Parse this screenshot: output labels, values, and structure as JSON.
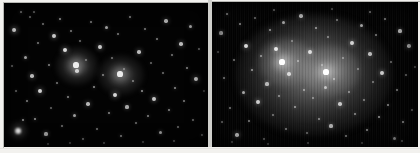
{
  "figure": {
    "background_color": "#f2f1ee",
    "width": 420,
    "height": 153,
    "divider_color": "#cfcfcb"
  },
  "panels": [
    {
      "id": "panel-left",
      "label": "Left panel",
      "description": "Raw star field with two faint compact cluster cores",
      "background_color": "#030303",
      "star_color": "#ffffff",
      "width": 204,
      "height": 144,
      "cores": [
        {
          "name": "core-a",
          "x": 72,
          "y": 62,
          "brightness": 0.46
        },
        {
          "name": "core-b",
          "x": 116,
          "y": 71,
          "brightness": 0.44
        }
      ],
      "stars": [
        [
          10,
          27,
          2.2,
          0.95
        ],
        [
          14,
          128,
          3.4,
          1.0
        ],
        [
          17,
          9,
          1.3,
          0.55
        ],
        [
          21,
          54,
          1.5,
          0.62
        ],
        [
          23,
          98,
          1.2,
          0.5
        ],
        [
          26,
          14,
          1.0,
          0.42
        ],
        [
          28,
          73,
          1.8,
          0.72
        ],
        [
          31,
          116,
          1.4,
          0.58
        ],
        [
          34,
          40,
          1.2,
          0.48
        ],
        [
          36,
          88,
          2.0,
          0.82
        ],
        [
          39,
          21,
          1.1,
          0.45
        ],
        [
          42,
          131,
          1.6,
          0.66
        ],
        [
          45,
          62,
          1.3,
          0.52
        ],
        [
          47,
          105,
          1.0,
          0.4
        ],
        [
          50,
          33,
          1.9,
          0.78
        ],
        [
          53,
          80,
          1.2,
          0.47
        ],
        [
          56,
          16,
          1.4,
          0.58
        ],
        [
          58,
          123,
          1.1,
          0.44
        ],
        [
          61,
          47,
          2.1,
          0.86
        ],
        [
          64,
          94,
          1.3,
          0.53
        ],
        [
          67,
          28,
          1.2,
          0.49
        ],
        [
          70,
          112,
          1.5,
          0.61
        ],
        [
          73,
          68,
          1.8,
          0.74
        ],
        [
          76,
          38,
          1.1,
          0.43
        ],
        [
          79,
          136,
          1.3,
          0.52
        ],
        [
          82,
          57,
          1.0,
          0.41
        ],
        [
          84,
          101,
          1.7,
          0.7
        ],
        [
          87,
          19,
          1.2,
          0.48
        ],
        [
          90,
          84,
          1.4,
          0.57
        ],
        [
          93,
          126,
          1.1,
          0.45
        ],
        [
          96,
          44,
          1.9,
          0.79
        ],
        [
          99,
          72,
          1.2,
          0.5
        ],
        [
          102,
          24,
          1.5,
          0.61
        ],
        [
          105,
          110,
          1.3,
          0.53
        ],
        [
          108,
          55,
          1.1,
          0.44
        ],
        [
          111,
          92,
          2.0,
          0.83
        ],
        [
          114,
          31,
          1.2,
          0.49
        ],
        [
          117,
          133,
          1.4,
          0.56
        ],
        [
          120,
          66,
          1.0,
          0.4
        ],
        [
          123,
          104,
          1.6,
          0.65
        ],
        [
          126,
          14,
          1.3,
          0.54
        ],
        [
          129,
          78,
          1.2,
          0.47
        ],
        [
          132,
          120,
          1.1,
          0.43
        ],
        [
          135,
          49,
          1.8,
          0.73
        ],
        [
          138,
          88,
          1.4,
          0.58
        ],
        [
          141,
          26,
          1.2,
          0.48
        ],
        [
          144,
          113,
          1.3,
          0.52
        ],
        [
          147,
          60,
          1.0,
          0.41
        ],
        [
          150,
          96,
          1.9,
          0.77
        ],
        [
          153,
          36,
          1.2,
          0.5
        ],
        [
          156,
          129,
          1.5,
          0.6
        ],
        [
          159,
          70,
          1.1,
          0.44
        ],
        [
          162,
          18,
          1.7,
          0.68
        ],
        [
          165,
          107,
          1.3,
          0.53
        ],
        [
          168,
          52,
          1.2,
          0.47
        ],
        [
          171,
          85,
          1.4,
          0.56
        ],
        [
          174,
          124,
          1.0,
          0.4
        ],
        [
          177,
          41,
          1.8,
          0.72
        ],
        [
          180,
          98,
          1.2,
          0.49
        ],
        [
          183,
          65,
          1.3,
          0.52
        ],
        [
          186,
          23,
          1.5,
          0.62
        ],
        [
          189,
          117,
          1.1,
          0.43
        ],
        [
          192,
          76,
          2.0,
          0.8
        ],
        [
          195,
          46,
          1.2,
          0.48
        ],
        [
          198,
          132,
          1.3,
          0.51
        ],
        [
          200,
          88,
          1.0,
          0.4
        ],
        [
          8,
          63,
          1.2,
          0.48
        ],
        [
          12,
          88,
          1.1,
          0.44
        ],
        [
          19,
          117,
          1.4,
          0.57
        ],
        [
          30,
          9,
          1.2,
          0.47
        ],
        [
          44,
          141,
          1.0,
          0.4
        ],
        [
          66,
          140,
          1.1,
          0.42
        ],
        [
          100,
          140,
          1.2,
          0.46
        ],
        [
          139,
          139,
          1.0,
          0.4
        ],
        [
          170,
          138,
          1.1,
          0.43
        ]
      ]
    },
    {
      "id": "panel-right",
      "label": "Right panel",
      "description": "Same field with large diffuse halo revealed and vertical readout streaks",
      "background_color": "#030303",
      "star_color": "#ffffff",
      "width": 206,
      "height": 145,
      "halo": {
        "cx": 102,
        "cy": 73,
        "rx": 78,
        "ry": 61
      },
      "cores": [
        {
          "name": "core-a",
          "x": 70,
          "y": 60,
          "brightness": 0.6
        },
        {
          "name": "core-b",
          "x": 114,
          "y": 70,
          "brightness": 0.56
        }
      ],
      "stars": [
        [
          9,
          31,
          1.6,
          0.68
        ],
        [
          12,
          76,
          1.3,
          0.54
        ],
        [
          15,
          12,
          1.4,
          0.58
        ],
        [
          18,
          106,
          1.2,
          0.48
        ],
        [
          22,
          58,
          1.1,
          0.45
        ],
        [
          25,
          133,
          1.8,
          0.74
        ],
        [
          28,
          22,
          1.3,
          0.52
        ],
        [
          31,
          90,
          1.5,
          0.62
        ],
        [
          34,
          44,
          2.0,
          0.84
        ],
        [
          37,
          119,
          1.2,
          0.49
        ],
        [
          40,
          68,
          1.4,
          0.57
        ],
        [
          43,
          16,
          1.1,
          0.43
        ],
        [
          46,
          100,
          1.9,
          0.78
        ],
        [
          49,
          54,
          1.3,
          0.53
        ],
        [
          52,
          137,
          1.2,
          0.47
        ],
        [
          55,
          82,
          1.6,
          0.66
        ],
        [
          58,
          28,
          1.4,
          0.56
        ],
        [
          61,
          113,
          1.1,
          0.44
        ],
        [
          64,
          47,
          2.1,
          0.88
        ],
        [
          67,
          94,
          1.3,
          0.52
        ],
        [
          71,
          20,
          1.5,
          0.6
        ],
        [
          74,
          127,
          1.2,
          0.48
        ],
        [
          77,
          72,
          1.8,
          0.74
        ],
        [
          80,
          39,
          1.0,
          0.41
        ],
        [
          83,
          105,
          1.4,
          0.57
        ],
        [
          86,
          59,
          1.2,
          0.49
        ],
        [
          89,
          14,
          1.7,
          0.7
        ],
        [
          92,
          88,
          1.3,
          0.53
        ],
        [
          95,
          131,
          1.1,
          0.44
        ],
        [
          98,
          50,
          1.9,
          0.8
        ],
        [
          101,
          96,
          1.2,
          0.47
        ],
        [
          104,
          26,
          1.4,
          0.58
        ],
        [
          107,
          117,
          1.3,
          0.52
        ],
        [
          110,
          63,
          1.0,
          0.4
        ],
        [
          113,
          85,
          1.5,
          0.61
        ],
        [
          116,
          35,
          1.2,
          0.48
        ],
        [
          119,
          124,
          1.6,
          0.65
        ],
        [
          122,
          77,
          1.3,
          0.53
        ],
        [
          125,
          18,
          1.2,
          0.46
        ],
        [
          128,
          102,
          1.8,
          0.73
        ],
        [
          131,
          56,
          1.1,
          0.43
        ],
        [
          134,
          134,
          1.4,
          0.56
        ],
        [
          137,
          90,
          1.2,
          0.49
        ],
        [
          140,
          41,
          1.9,
          0.79
        ],
        [
          143,
          112,
          1.3,
          0.52
        ],
        [
          146,
          67,
          1.0,
          0.41
        ],
        [
          149,
          23,
          1.5,
          0.62
        ],
        [
          152,
          98,
          1.2,
          0.47
        ],
        [
          155,
          128,
          1.3,
          0.54
        ],
        [
          158,
          52,
          1.7,
          0.69
        ],
        [
          161,
          80,
          1.1,
          0.44
        ],
        [
          164,
          33,
          1.2,
          0.48
        ],
        [
          167,
          115,
          1.4,
          0.58
        ],
        [
          170,
          71,
          1.9,
          0.77
        ],
        [
          173,
          17,
          1.2,
          0.49
        ],
        [
          176,
          103,
          1.3,
          0.52
        ],
        [
          179,
          60,
          1.0,
          0.4
        ],
        [
          182,
          136,
          1.5,
          0.6
        ],
        [
          185,
          88,
          1.2,
          0.47
        ],
        [
          188,
          29,
          1.6,
          0.66
        ],
        [
          191,
          120,
          1.3,
          0.53
        ],
        [
          194,
          73,
          1.1,
          0.43
        ],
        [
          197,
          44,
          1.8,
          0.72
        ],
        [
          200,
          108,
          1.2,
          0.48
        ],
        [
          203,
          65,
          1.3,
          0.52
        ],
        [
          6,
          50,
          1.1,
          0.44
        ],
        [
          10,
          120,
          1.2,
          0.47
        ],
        [
          20,
          140,
          1.0,
          0.4
        ],
        [
          56,
          142,
          1.1,
          0.42
        ],
        [
          96,
          141,
          1.2,
          0.45
        ],
        [
          150,
          141,
          1.0,
          0.4
        ],
        [
          190,
          139,
          1.1,
          0.43
        ],
        [
          62,
          8,
          1.2,
          0.48
        ],
        [
          120,
          7,
          1.1,
          0.44
        ],
        [
          158,
          10,
          1.3,
          0.52
        ]
      ]
    }
  ]
}
